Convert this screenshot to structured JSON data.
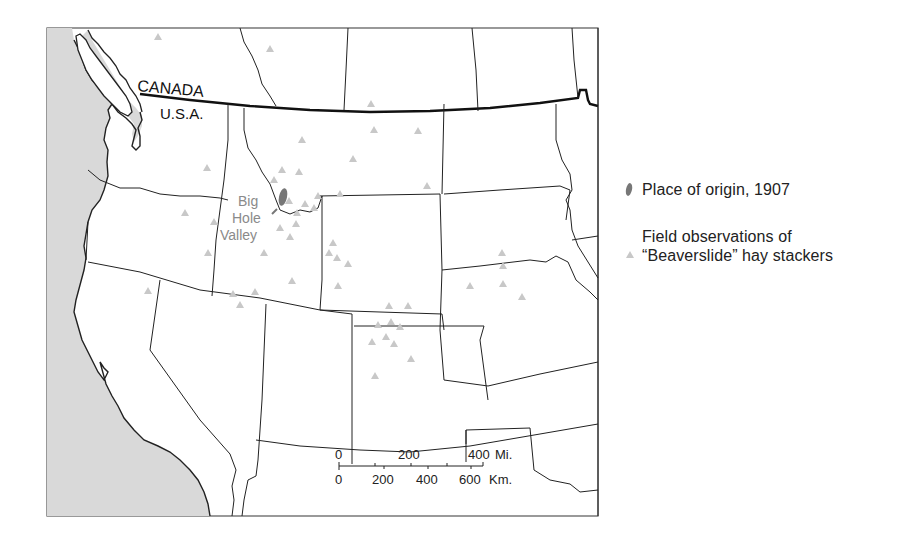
{
  "map": {
    "labels": {
      "canada": "CANADA",
      "usa": "U.S.A.",
      "big_hole_valley": [
        "Big",
        "Hole",
        "Valley"
      ]
    },
    "colors": {
      "ocean": "#d9d9d9",
      "land": "#ffffff",
      "border": "#222222",
      "observation": "#c8c8c8",
      "origin": "#777777",
      "label_gray": "#8a8a8a"
    },
    "observation_points": [
      [
        158,
        37
      ],
      [
        270,
        49
      ],
      [
        371,
        104
      ],
      [
        374,
        130
      ],
      [
        418,
        131
      ],
      [
        302,
        140
      ],
      [
        353,
        159
      ],
      [
        207,
        168
      ],
      [
        282,
        170
      ],
      [
        299,
        172
      ],
      [
        274,
        180
      ],
      [
        427,
        186
      ],
      [
        340,
        194
      ],
      [
        318,
        196
      ],
      [
        185,
        213
      ],
      [
        289,
        201
      ],
      [
        305,
        204
      ],
      [
        314,
        208
      ],
      [
        297,
        213
      ],
      [
        214,
        222
      ],
      [
        296,
        224
      ],
      [
        280,
        228
      ],
      [
        290,
        237
      ],
      [
        333,
        243
      ],
      [
        208,
        253
      ],
      [
        264,
        253
      ],
      [
        329,
        253
      ],
      [
        337,
        258
      ],
      [
        348,
        264
      ],
      [
        292,
        281
      ],
      [
        338,
        286
      ],
      [
        148,
        291
      ],
      [
        255,
        292
      ],
      [
        233,
        294
      ],
      [
        240,
        305
      ],
      [
        389,
        306
      ],
      [
        408,
        306
      ],
      [
        378,
        325
      ],
      [
        391,
        322
      ],
      [
        400,
        327
      ],
      [
        372,
        342
      ],
      [
        386,
        337
      ],
      [
        394,
        344
      ],
      [
        411,
        359
      ],
      [
        375,
        376
      ],
      [
        502,
        253
      ],
      [
        503,
        266
      ],
      [
        470,
        286
      ],
      [
        503,
        284
      ],
      [
        522,
        297
      ]
    ],
    "origin": {
      "cx": 283,
      "cy": 197,
      "label": "Place of origin, 1907"
    }
  },
  "legend": {
    "origin_label": "Place of origin, 1907",
    "observation_label_line1": "Field observations of",
    "observation_label_line2": "“Beaverslide” hay stackers"
  },
  "scale_bar": {
    "miles": {
      "ticks": [
        "0",
        "200",
        "400"
      ],
      "unit": "Mi."
    },
    "km": {
      "ticks": [
        "0",
        "200",
        "400",
        "600"
      ],
      "unit": "Km."
    }
  }
}
